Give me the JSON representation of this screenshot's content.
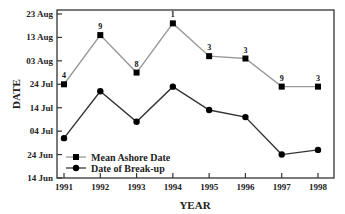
{
  "chart_data": {
    "type": "line",
    "title": "",
    "xlabel": "YEAR",
    "ylabel": "DATE",
    "x": [
      1991,
      1992,
      1993,
      1994,
      1995,
      1996,
      1997,
      1998
    ],
    "y_tick_labels": [
      "14 Jun",
      "24 Jun",
      "04 Jul",
      "14 Jul",
      "24 Jul",
      "03 Aug",
      "13 Aug",
      "23 Aug"
    ],
    "y_tick_day_offsets": [
      0,
      10,
      20,
      30,
      40,
      50,
      60,
      70
    ],
    "ylim_day_offsets": [
      0,
      70
    ],
    "y_axis_note": "Day offsets measured from 14 Jun",
    "grid": false,
    "legend_position": "lower-left inside",
    "series": [
      {
        "name": "Mean Ashore Date",
        "marker": "square",
        "color": "#9a9a9a",
        "marker_color": "#000000",
        "dates": [
          "24 Jul",
          "14 Aug",
          "29 Jul",
          "19 Aug",
          "05 Aug",
          "04 Aug",
          "23 Jul",
          "23 Jul"
        ],
        "values": [
          40,
          61,
          45,
          66,
          52,
          51,
          39,
          39
        ],
        "annotations": [
          "4",
          "9",
          "8",
          "1",
          "3",
          "3",
          "9",
          "3"
        ]
      },
      {
        "name": "Date of Break-up",
        "marker": "circle",
        "color": "#333333",
        "marker_color": "#000000",
        "dates": [
          "01 Jul",
          "21 Jul",
          "08 Jul",
          "23 Jul",
          "13 Jul",
          "10 Jul",
          "24 Jun",
          "26 Jun"
        ],
        "values": [
          17,
          37,
          24,
          39,
          29,
          26,
          10,
          12
        ]
      }
    ]
  },
  "legend": {
    "items": [
      "Mean Ashore Date",
      "Date of Break-up"
    ]
  }
}
